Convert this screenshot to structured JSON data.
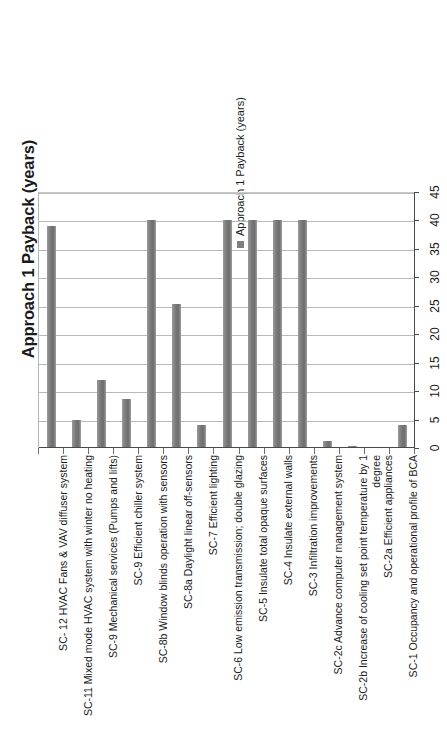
{
  "chart_data": {
    "type": "bar",
    "title": "",
    "xlabel": "",
    "ylabel": "Approach 1 Payback (years)",
    "ylim": [
      0,
      45
    ],
    "yticks": [
      0,
      5,
      10,
      15,
      20,
      25,
      30,
      35,
      40,
      45
    ],
    "grid": true,
    "orientation": "vertical",
    "legend_position": "top-right",
    "bar_color": "#7f7f7f",
    "series": [
      {
        "name": "Approach 1 Payback (years)",
        "values": [
          39,
          5,
          12,
          8.7,
          40,
          25.3,
          4,
          40,
          40,
          40,
          40,
          1.2,
          0.3,
          0.15,
          4
        ]
      }
    ],
    "categories": [
      "SC- 12 HVAC Fans & VAV diffuser system",
      "SC-11 Mixed mode HVAC system with winter no heating",
      "SC-9 Mechanical services (Pumps and lifts)",
      "SC-9 Efficient chiller system",
      "SC-8b Window blinds operation with sensors",
      "SC-8a Daylight linear off-sensors",
      "SC-7 Efficient lighting",
      "SC-6 Low emission transmission; double glazing",
      "SC-5 Insulate total opaque surfaces",
      "SC-4 Insulate external walls",
      "SC-3 Infiltration improvements",
      "SC-2c Advance computer management system",
      "SC-2b Increase of cooling set point temperature by 1 degree",
      "SC-2a Efficient appliances",
      "SC-1 Occupancy and operational profile of BCA"
    ]
  },
  "legend": {
    "entries": [
      {
        "label": "Approach 1 Payback (years)",
        "color": "#7f7f7f"
      }
    ]
  },
  "axis": {
    "y_title": "Approach 1 Payback (years)",
    "y_tick_labels": [
      "0",
      "5",
      "10",
      "15",
      "20",
      "25",
      "30",
      "35",
      "40",
      "45"
    ]
  }
}
